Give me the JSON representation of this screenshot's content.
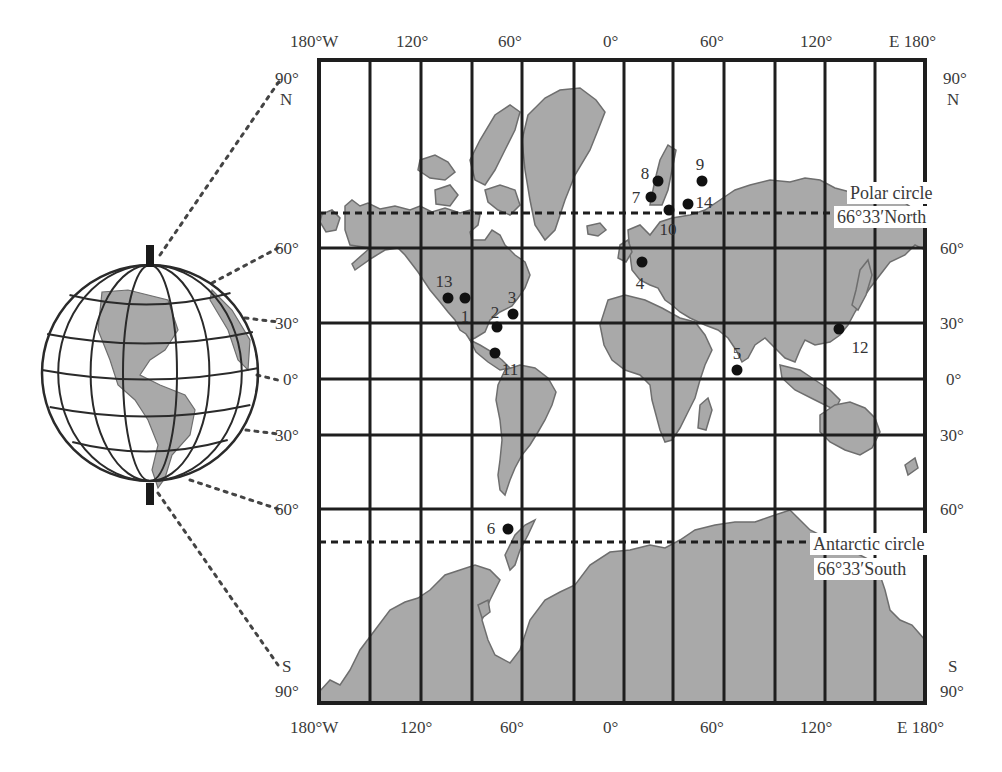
{
  "map": {
    "type": "Mercator world map with globe inset",
    "top_longitude_labels": [
      {
        "text": "180°W",
        "x": 290
      },
      {
        "text": "120°",
        "x": 396
      },
      {
        "text": "60°",
        "x": 498
      },
      {
        "text": "0°",
        "x": 603
      },
      {
        "text": "60°",
        "x": 700
      },
      {
        "text": "120°",
        "x": 800
      },
      {
        "text": "E 180°",
        "x": 889
      }
    ],
    "bottom_longitude_labels": [
      {
        "text": "180°W",
        "x": 290
      },
      {
        "text": "120°",
        "x": 400
      },
      {
        "text": "60°",
        "x": 500
      },
      {
        "text": "0°",
        "x": 603
      },
      {
        "text": "60°",
        "x": 700
      },
      {
        "text": "120°",
        "x": 800
      },
      {
        "text": "E 180°",
        "x": 897
      }
    ],
    "left_latitude_labels": [
      {
        "text": "90°",
        "y": 70,
        "x": 284
      },
      {
        "text": "N",
        "y": 91,
        "x": 289
      },
      {
        "text": "60°",
        "y": 240,
        "x": 284
      },
      {
        "text": "30°",
        "y": 315,
        "x": 284
      },
      {
        "text": "0°",
        "y": 371,
        "x": 292
      },
      {
        "text": "30°",
        "y": 427,
        "x": 284
      },
      {
        "text": "60°",
        "y": 501,
        "x": 284
      },
      {
        "text": "S",
        "y": 658,
        "x": 291
      },
      {
        "text": "90°",
        "y": 683,
        "x": 284
      }
    ],
    "right_latitude_labels": [
      {
        "text": "90°",
        "y": 70,
        "x": 943
      },
      {
        "text": "N",
        "y": 91,
        "x": 947
      },
      {
        "text": "60°",
        "y": 240,
        "x": 940
      },
      {
        "text": "30°",
        "y": 315,
        "x": 940
      },
      {
        "text": "0°",
        "y": 371,
        "x": 946
      },
      {
        "text": "30°",
        "y": 427,
        "x": 940
      },
      {
        "text": "60°",
        "y": 501,
        "x": 940
      },
      {
        "text": "S",
        "y": 658,
        "x": 948
      },
      {
        "text": "90°",
        "y": 683,
        "x": 940
      }
    ],
    "polar_circle": {
      "title": "Polar circle",
      "value": "66°33′North",
      "y": 213
    },
    "antarctic_circle": {
      "title": "Antarctic circle",
      "value": "66°33′South",
      "y": 542
    },
    "grid": {
      "left": 319,
      "right": 925,
      "top": 60,
      "bottom": 703,
      "meridians_x": [
        319,
        370,
        421,
        472,
        522,
        574,
        624,
        673,
        724,
        775,
        825,
        875,
        925
      ],
      "parallels_y": [
        248,
        323,
        379,
        435,
        509
      ]
    },
    "colors": {
      "land": "#a9a9a9",
      "land_stroke": "#6e6e6e",
      "grid": "#1e1e1e",
      "marker": "#111111",
      "dotted": "#444444"
    },
    "markers": [
      {
        "id": "1",
        "x": 465,
        "y": 298,
        "lx": 465,
        "ly": 316
      },
      {
        "id": "2",
        "x": 497,
        "y": 327,
        "lx": 495,
        "ly": 312
      },
      {
        "id": "3",
        "x": 513,
        "y": 314,
        "lx": 512,
        "ly": 297
      },
      {
        "id": "4",
        "x": 642,
        "y": 262,
        "lx": 640,
        "ly": 283
      },
      {
        "id": "5",
        "x": 737,
        "y": 370,
        "lx": 737,
        "ly": 353
      },
      {
        "id": "6",
        "x": 508,
        "y": 529,
        "lx": 491,
        "ly": 528
      },
      {
        "id": "7",
        "x": 651,
        "y": 197,
        "lx": 636,
        "ly": 197
      },
      {
        "id": "8",
        "x": 658,
        "y": 181,
        "lx": 645,
        "ly": 173
      },
      {
        "id": "9",
        "x": 702,
        "y": 181,
        "lx": 700,
        "ly": 164
      },
      {
        "id": "10",
        "x": 669,
        "y": 210,
        "lx": 668,
        "ly": 229
      },
      {
        "id": "11",
        "x": 495,
        "y": 353,
        "lx": 510,
        "ly": 369
      },
      {
        "id": "12",
        "x": 839,
        "y": 329,
        "lx": 860,
        "ly": 347
      },
      {
        "id": "13",
        "x": 448,
        "y": 298,
        "lx": 444,
        "ly": 281
      },
      {
        "id": "14",
        "x": 688,
        "y": 204,
        "lx": 704,
        "ly": 202
      }
    ],
    "land_paths": [
      {
        "name": "north-america",
        "d": "M345,206 L352,200 L360,206 L368,203 L380,209 L395,206 L410,210 L420,206 L432,212 L445,208 L460,213 L470,210 L480,215 L478,225 L470,232 L472,240 L485,240 L492,230 L500,235 L505,245 L515,255 L525,262 L530,275 L525,288 L518,298 L512,306 L500,312 L490,320 L485,332 L475,338 L470,340 L466,334 L460,330 L455,320 L448,312 L440,302 L430,290 L418,272 L405,255 L398,248 L385,250 L372,258 L355,270 L352,264 L362,255 L370,248 L350,245 L345,230 Z"
      },
      {
        "name": "alaska-west",
        "d": "M322,214 L332,210 L340,218 L336,230 L326,232 L320,222 Z"
      },
      {
        "name": "canadian-arctic-1",
        "d": "M420,160 L435,155 L448,162 L455,172 L445,180 L430,178 L418,170 Z"
      },
      {
        "name": "canadian-arctic-2",
        "d": "M435,190 L450,185 L458,195 L450,206 L436,204 Z"
      },
      {
        "name": "canadian-arctic-3",
        "d": "M470,160 L480,140 L495,115 L510,105 L520,112 L515,130 L505,150 L495,170 L485,185 L475,180 Z"
      },
      {
        "name": "baffin",
        "d": "M485,190 L500,185 L515,190 L520,205 L510,215 L498,210 L488,202 Z"
      },
      {
        "name": "greenland",
        "d": "M528,115 L545,98 L560,90 L580,88 L596,100 L605,112 L598,130 L590,150 L575,175 L565,200 L555,230 L545,240 L535,225 L530,200 L525,170 L522,140 Z"
      },
      {
        "name": "iceland",
        "d": "M587,226 L600,223 L606,230 L598,236 L588,234 Z"
      },
      {
        "name": "central-america",
        "d": "M470,340 L480,345 L492,352 L502,360 L510,368 L500,370 L488,362 L476,352 Z"
      },
      {
        "name": "south-america",
        "d": "M505,370 L520,365 L535,368 L548,378 L556,392 L552,405 L545,420 L538,432 L530,445 L522,455 L515,468 L510,480 L505,495 L500,490 L498,475 L500,460 L502,440 L500,420 L496,400 L498,385 Z"
      },
      {
        "name": "eurasia",
        "d": "M628,230 L640,225 L650,235 L660,222 L672,218 L690,215 L705,210 L720,200 L735,190 L750,185 L770,180 L790,182 L805,178 L820,180 L835,188 L850,192 L870,190 L895,196 L915,210 L925,215 L925,250 L915,245 L905,255 L890,262 L880,275 L870,288 L862,300 L855,312 L848,325 L840,335 L830,342 L815,345 L805,340 L800,350 L795,362 L785,358 L775,348 L765,338 L755,345 L748,358 L742,362 L736,350 L728,338 L718,330 L705,325 L690,318 L680,312 L672,305 L665,300 L658,288 L650,285 L640,280 L632,270 L630,255 Z"
      },
      {
        "name": "scandinavia",
        "d": "M650,205 L655,180 L660,160 L668,145 L676,150 L672,170 L668,190 L662,205 Z"
      },
      {
        "name": "uk",
        "d": "M620,245 L628,240 L632,252 L626,262 L618,258 Z"
      },
      {
        "name": "africa",
        "d": "M608,300 L625,295 L645,300 L662,308 L680,318 L695,322 L705,335 L712,350 L705,365 L700,380 L695,398 L688,412 L680,428 L672,440 L665,442 L660,430 L656,415 L652,400 L650,385 L640,375 L625,370 L612,360 L604,345 L600,325 Z"
      },
      {
        "name": "madagascar",
        "d": "M700,405 L708,398 L712,410 L706,430 L698,428 Z"
      },
      {
        "name": "japan",
        "d": "M860,270 L868,260 L872,275 L866,295 L858,310 L852,305 L856,290 Z"
      },
      {
        "name": "southeast-asia-islands",
        "d": "M780,365 L800,370 L815,380 L830,390 L840,400 L835,410 L815,400 L795,390 L782,378 Z"
      },
      {
        "name": "australia",
        "d": "M820,415 L835,405 L850,402 L865,408 L875,418 L880,432 L872,448 L860,455 L845,450 L830,442 L820,432 Z"
      },
      {
        "name": "new-zealand",
        "d": "M905,465 L915,458 L918,468 L908,475 Z"
      },
      {
        "name": "antarctic-peninsula",
        "d": "M505,555 L515,535 L525,525 L535,520 L528,535 L520,550 L515,565 L510,570 Z"
      },
      {
        "name": "antarctica",
        "d": "M319,692 L330,680 L340,685 L350,670 L360,650 L375,630 L390,610 L405,602 L418,598 L430,590 L445,575 L460,570 L475,565 L490,570 L500,580 L490,600 L482,620 L488,640 L495,655 L510,663 L520,650 L530,620 L545,600 L560,592 L575,585 L590,565 L610,552 L630,550 L650,545 L665,548 L680,540 L695,530 L715,525 L735,522 L755,522 L775,515 L790,510 L800,520 L810,530 L830,540 L850,550 L870,560 L880,575 L885,590 L890,610 L900,620 L912,625 L925,640 L925,703 L319,703 Z"
      },
      {
        "name": "antarctic-island",
        "d": "M478,605 L488,600 L490,612 L482,618 Z"
      }
    ],
    "globe": {
      "cx": 150,
      "cy": 373,
      "r": 108,
      "axis_top": 245,
      "axis_bottom": 505,
      "connectors": [
        {
          "from": [
            160,
            255
          ],
          "to": [
            280,
            80
          ]
        },
        {
          "from": [
            212,
            283
          ],
          "to": [
            278,
            248
          ]
        },
        {
          "from": [
            245,
            318
          ],
          "to": [
            278,
            322
          ]
        },
        {
          "from": [
            257,
            375
          ],
          "to": [
            278,
            380
          ]
        },
        {
          "from": [
            246,
            430
          ],
          "to": [
            278,
            434
          ]
        },
        {
          "from": [
            190,
            480
          ],
          "to": [
            278,
            509
          ]
        },
        {
          "from": [
            158,
            493
          ],
          "to": [
            278,
            665
          ]
        }
      ]
    }
  }
}
